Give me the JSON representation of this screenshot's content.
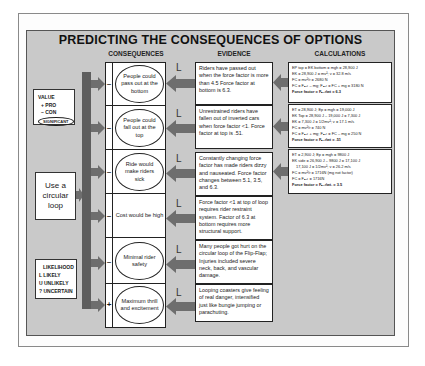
{
  "title": "PREDICTING THE CONSEQUENCES OF OPTIONS",
  "columns": {
    "consequences": "CONSEQUENCES",
    "evidence": "EVIDENCE",
    "calculations": "CALCULATIONS"
  },
  "value_legend": {
    "heading": "VALUE",
    "pro": "+ PRO",
    "con": "– CON",
    "significant": "SIGNIFICANT"
  },
  "decision": "Use a circular loop",
  "likelihood_legend": {
    "heading": "LIKELIHOOD",
    "likely": "L  LIKELY",
    "unlikely": "U  UNLIKELY",
    "uncertain": "?  UNCERTAIN"
  },
  "rows": [
    {
      "sign": "–",
      "consequence": "People could pass out at the bottom",
      "significant": true,
      "likelihood": "L",
      "evidence": "Riders have passed out when the force factor is more than 4.5 Force factor at bottom is 6.3."
    },
    {
      "sign": "–",
      "consequence": "People could fall out at the top",
      "significant": true,
      "likelihood": "L",
      "evidence": "Unrestrained riders have fallen out of inverted cars when force factor <1. Force factor at top is .51."
    },
    {
      "sign": "–",
      "consequence": "Ride would make riders sick",
      "significant": true,
      "likelihood": "L",
      "evidence": "Constantly changing force factor has made riders dizzy and nauseated. Force factor changes between 5.1, 3.5, and 6.3."
    },
    {
      "sign": "–",
      "consequence": "Cost would be high",
      "significant": false,
      "likelihood": "L",
      "evidence": "Force factor <1 at top of loop requires rider restraint system. Factor of 6.3 at bottom requires more structural support."
    },
    {
      "sign": "–",
      "consequence": "Minimal rider safety",
      "significant": true,
      "likelihood": "L",
      "evidence": "Many people got hurt on the circular loop of the Flip-Flap; Injuries included severe neck, back, and vascular damage."
    },
    {
      "sign": "+",
      "consequence": "Maximum thrill and excitement",
      "significant": true,
      "likelihood": "L",
      "evidence": "Looping coasters give feeling of real danger, intensified just like bungie jumping or parachuting."
    }
  ],
  "calculations": [
    {
      "lines": [
        "EP top = EK bottom = mgh = 28,900 J",
        "EK = 28,900 J = mv²; v = 32.8 m/s",
        "FC = mv²/r = 2680 N",
        "FC = Fₙₑₜ – mg; Fₙₑₜ = FC + mg = 3180 N"
      ],
      "result": "Force factor = Fₙₑₜ/wt = 6.3"
    },
    {
      "lines": [
        "ET = 28,900 J; Ep = mgh = 19,000 J",
        "EK Top = 28,900 J – 19,000 J = 7,300 J",
        "EK = 7,300 J = 1/2mv²; v = 17.1 m/s",
        "FC = mv²/r = 740 N",
        "FC = Fₙₑₜ + mg; Fₙₑₜ = FC – mg = 250 N"
      ],
      "result": "Force factor = Fₙₑₜ/wt = .51"
    },
    {
      "lines": [
        "ET = 2,900 J; Ep = mgh = 9800 J",
        "EK side = 26,900 J – 9800 J = 17,100 J",
        "17,100 J = 1/2mv²; v = 26.2 m/s",
        "FC = mv²/r = 1716N (mg not factor)",
        "FC = Fₙₑₜ = 1716N"
      ],
      "result": "Force factor = Fₙₑₜ/wt. = 3.5"
    }
  ],
  "colors": {
    "panel": "#c9c9c9",
    "arrow": "#6e6e6e",
    "bar": "#5e5e5e"
  }
}
